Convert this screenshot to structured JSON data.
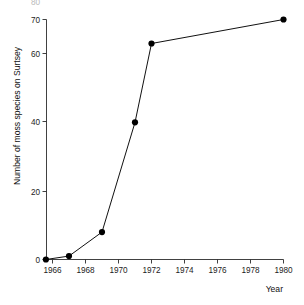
{
  "chart_data": {
    "type": "line",
    "title": "",
    "xlabel": "Year",
    "ylabel": "Number of moss species on Surtsey",
    "x": [
      1965.6,
      1967,
      1969,
      1971,
      1972,
      1980
    ],
    "values": [
      0,
      1,
      8,
      40,
      63,
      70
    ],
    "series": [
      {
        "name": "Number of moss species on Surtsey",
        "x": [
          1965.6,
          1967,
          1969,
          1971,
          1972,
          1980
        ],
        "values": [
          0,
          1,
          8,
          40,
          63,
          70
        ]
      }
    ],
    "xlim": [
      1965.3,
      1980.4
    ],
    "ylim": [
      0,
      70
    ],
    "xticks": [
      1966,
      1968,
      1970,
      1972,
      1974,
      1976,
      1978,
      1980
    ],
    "xticklabels": [
      "1966",
      "1968",
      "1970",
      "1972",
      "1974",
      "1976",
      "1978",
      "1980"
    ],
    "yticks": [
      0,
      20,
      40,
      60,
      70
    ],
    "yticklabels": [
      "0",
      "20",
      "40",
      "60",
      "70"
    ],
    "grid": false,
    "legend": false,
    "legend_position": "none",
    "marker": "filled-circle",
    "line_color": "#111111",
    "marker_color": "#000000",
    "background_color": "#ffffff"
  },
  "axes": {
    "y_axis_title": "Number of moss species on Surtsey",
    "x_axis_title": "Year",
    "y_tick_labels": [
      "70",
      "60",
      "40",
      "20",
      "0"
    ],
    "x_tick_labels": [
      "1966",
      "1968",
      "1970",
      "1972",
      "1974",
      "1976",
      "1978",
      "1980"
    ]
  },
  "clipped": {
    "top_fragment": "80"
  }
}
